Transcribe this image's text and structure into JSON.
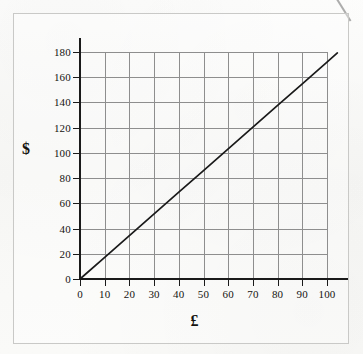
{
  "figure": {
    "background_color": "#fbfbfa",
    "frame_color": "#c9c9c7",
    "grid_color": "#8e8e8e",
    "axis_color": "#1a1a1a",
    "line_color": "#1a1a1a"
  },
  "chart_data": {
    "type": "line",
    "title": "",
    "subtitle": "",
    "xlabel": "£",
    "ylabel": "$",
    "xlim": [
      0,
      100
    ],
    "ylim": [
      0,
      180
    ],
    "grid": true,
    "legend": "none",
    "x_ticks": [
      0,
      10,
      20,
      30,
      40,
      50,
      60,
      70,
      80,
      90,
      100
    ],
    "x_tick_labels": [
      "0",
      "10",
      "20",
      "30",
      "40",
      "50",
      "60",
      "70",
      "80",
      "90",
      "100"
    ],
    "y_ticks": [
      0,
      20,
      40,
      60,
      80,
      100,
      120,
      140,
      160,
      180
    ],
    "y_tick_labels": [
      "0",
      "20",
      "40",
      "60",
      "80",
      "100",
      "120",
      "140",
      "160",
      "180"
    ],
    "series": [
      {
        "name": "conversion-line",
        "x": [
          0,
          10,
          20,
          30,
          40,
          50,
          60,
          70,
          80,
          90,
          100
        ],
        "values": [
          0,
          17.2,
          34.4,
          51.6,
          68.8,
          86,
          103.2,
          120.4,
          137.6,
          154.8,
          172
        ]
      }
    ],
    "annotations": []
  }
}
